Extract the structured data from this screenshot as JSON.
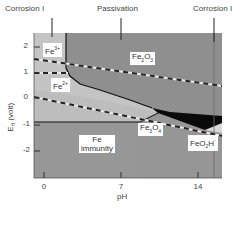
{
  "diagram": {
    "type": "Pourbaix diagram (iron)",
    "top_labels": [
      {
        "text": "Corrosion I",
        "x": 5,
        "y": 7
      },
      {
        "text": "Passivation",
        "x": 97,
        "y": 7
      },
      {
        "text": "Corrosion I",
        "x": 193,
        "y": 7
      }
    ],
    "x_axis": {
      "label": "pH",
      "ticks": [
        "0",
        "7",
        "14"
      ]
    },
    "y_axis": {
      "label": "E_H (volt)",
      "label_main": "E",
      "label_sub": "H",
      "label_suffix": " (volt)",
      "ticks": [
        "2",
        "1",
        "0",
        "-1",
        "-2"
      ]
    },
    "regions": [
      {
        "name": "Fe3+",
        "base": "Fe",
        "sup": "3+"
      },
      {
        "name": "Fe2+",
        "base": "Fe",
        "sup": "2+"
      },
      {
        "name": "Fe2O3",
        "base": "Fe",
        "sub1": "2",
        "mid": "O",
        "sub2": "3"
      },
      {
        "name": "Fe3O4",
        "base": "Fe",
        "sub1": "3",
        "mid": "O",
        "sub2": "4"
      },
      {
        "name": "FeO2H-",
        "base": "FeO",
        "sub1": "2",
        "mid": "H",
        "sup": "-"
      },
      {
        "name": "Fe immunity",
        "line1": "Fe",
        "line2": "immunity"
      }
    ],
    "colors": {
      "corrosion": "#c2c2c2",
      "passivation": "#8c8c8c",
      "immunity": "#999999",
      "black_band": "#0a0a0a",
      "dashed_light": "#e8e8e8",
      "dashed_dark": "#222222"
    }
  }
}
